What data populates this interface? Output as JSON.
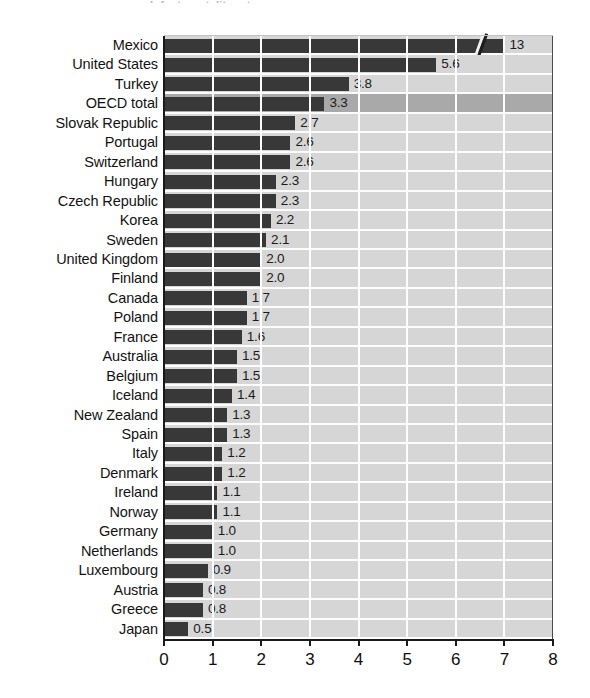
{
  "figure": {
    "title_remnant": "Infant mortality rates",
    "background_color": "#ffffff",
    "plot_background_color": "#d2d2d2",
    "bar_color": "#3b3b3b",
    "gridline_color": "#fdfdfd",
    "highlight_row_color": "#a9a9a9",
    "axis_color": "#1a1a1a"
  },
  "chart_data": {
    "type": "bar",
    "orientation": "horizontal",
    "title": "",
    "xlabel": "",
    "ylabel": "",
    "xlim": [
      0,
      8
    ],
    "xticks": [
      "0",
      "1",
      "2",
      "3",
      "4",
      "5",
      "6",
      "7",
      "8"
    ],
    "grid": true,
    "legend": null,
    "axis_break": {
      "category": "Mexico",
      "note": "bar truncated with diagonal break mark; true value exceeds axis maximum",
      "drawn_to": 7.0
    },
    "highlight_category": "OECD total",
    "categories": [
      "Mexico",
      "United States",
      "Turkey",
      "OECD total",
      "Slovak Republic",
      "Portugal",
      "Switzerland",
      "Hungary",
      "Czech Republic",
      "Korea",
      "Sweden",
      "United Kingdom",
      "Finland",
      "Canada",
      "Poland",
      "France",
      "Australia",
      "Belgium",
      "Iceland",
      "New Zealand",
      "Spain",
      "Italy",
      "Denmark",
      "Ireland",
      "Norway",
      "Germany",
      "Netherlands",
      "Luxembourg",
      "Austria",
      "Greece",
      "Japan"
    ],
    "values": [
      13,
      5.6,
      3.8,
      3.3,
      2.7,
      2.6,
      2.6,
      2.3,
      2.3,
      2.2,
      2.1,
      2.0,
      2.0,
      1.7,
      1.7,
      1.6,
      1.5,
      1.5,
      1.4,
      1.3,
      1.3,
      1.2,
      1.2,
      1.1,
      1.1,
      1.0,
      1.0,
      0.9,
      0.8,
      0.8,
      0.5
    ],
    "value_labels": [
      "13",
      "5.6",
      "3.8",
      "3.3",
      "2.7",
      "2.6",
      "2.6",
      "2.3",
      "2.3",
      "2.2",
      "2.1",
      "2.0",
      "2.0",
      "1.7",
      "1.7",
      "1.6",
      "1.5",
      "1.5",
      "1.4",
      "1.3",
      "1.3",
      "1.2",
      "1.2",
      "1.1",
      "1.1",
      "1.0",
      "1.0",
      "0.9",
      "0.8",
      "0.8",
      "0.5"
    ]
  }
}
